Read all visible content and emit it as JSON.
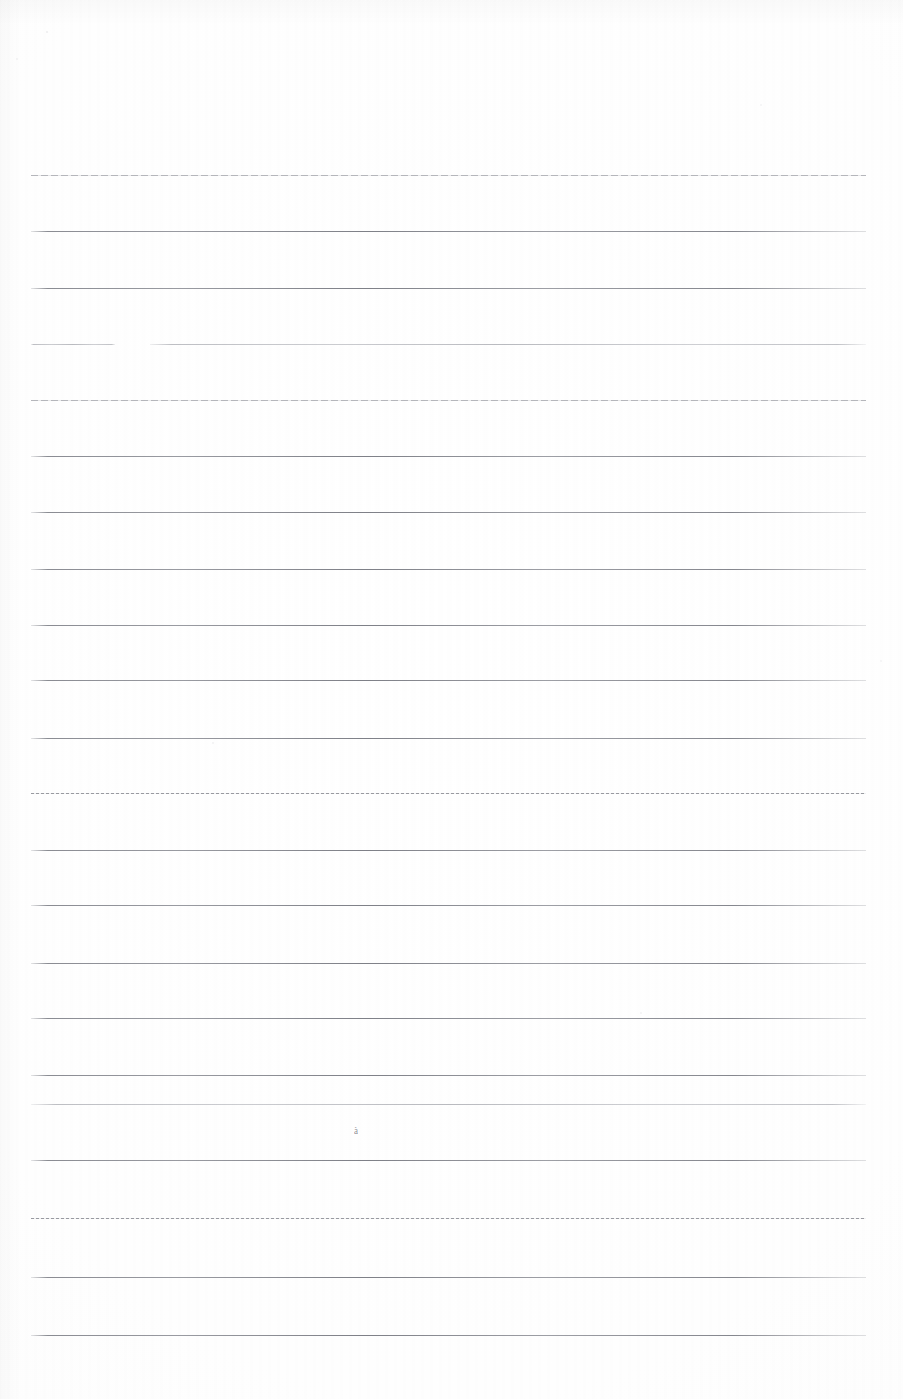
{
  "document": {
    "kind": "scanned-lined-paper",
    "title": "Blank ruled notebook page (scan)",
    "page_width": 903,
    "page_height": 1399,
    "background_color": "#fefefe",
    "rule_color": "#76787f",
    "rule_color_faint": "#9496a0",
    "text_content": "",
    "written_content_present": false,
    "margin_left": 31,
    "margin_right": 866,
    "line_spacing": 56,
    "line_count": 22
  },
  "ruled_lines": [
    {
      "index": 1,
      "y": 175,
      "style": "halftone",
      "segments": [
        {
          "x": 31,
          "width": 835
        }
      ]
    },
    {
      "index": 2,
      "y": 231,
      "style": "solid",
      "segments": [
        {
          "x": 31,
          "width": 835
        }
      ]
    },
    {
      "index": 3,
      "y": 288,
      "style": "solid",
      "segments": [
        {
          "x": 31,
          "width": 835
        }
      ]
    },
    {
      "index": 4,
      "y": 344,
      "style": "faint",
      "segments": [
        {
          "x": 31,
          "width": 84
        },
        {
          "x": 150,
          "width": 716
        }
      ]
    },
    {
      "index": 5,
      "y": 400,
      "style": "halftone",
      "segments": [
        {
          "x": 31,
          "width": 835
        }
      ]
    },
    {
      "index": 6,
      "y": 456,
      "style": "solid",
      "segments": [
        {
          "x": 31,
          "width": 835
        }
      ]
    },
    {
      "index": 7,
      "y": 512,
      "style": "solid",
      "segments": [
        {
          "x": 31,
          "width": 835
        }
      ]
    },
    {
      "index": 8,
      "y": 569,
      "style": "solid",
      "segments": [
        {
          "x": 31,
          "width": 835
        }
      ]
    },
    {
      "index": 9,
      "y": 625,
      "style": "solid",
      "segments": [
        {
          "x": 31,
          "width": 835
        }
      ]
    },
    {
      "index": 10,
      "y": 680,
      "style": "solid",
      "segments": [
        {
          "x": 31,
          "width": 835
        }
      ]
    },
    {
      "index": 11,
      "y": 738,
      "style": "solid",
      "segments": [
        {
          "x": 31,
          "width": 835
        }
      ]
    },
    {
      "index": 12,
      "y": 793,
      "style": "dotted",
      "segments": [
        {
          "x": 31,
          "width": 835
        }
      ]
    },
    {
      "index": 13,
      "y": 850,
      "style": "solid",
      "segments": [
        {
          "x": 31,
          "width": 835
        }
      ]
    },
    {
      "index": 14,
      "y": 905,
      "style": "solid",
      "segments": [
        {
          "x": 31,
          "width": 835
        }
      ]
    },
    {
      "index": 15,
      "y": 963,
      "style": "solid",
      "segments": [
        {
          "x": 31,
          "width": 835
        }
      ]
    },
    {
      "index": 16,
      "y": 1018,
      "style": "solid",
      "segments": [
        {
          "x": 31,
          "width": 835
        }
      ]
    },
    {
      "index": 17,
      "y": 1075,
      "style": "solid",
      "segments": [
        {
          "x": 31,
          "width": 835
        }
      ]
    },
    {
      "index": 18,
      "y": 1104,
      "style": "faint",
      "segments": [
        {
          "x": 31,
          "width": 835
        }
      ]
    },
    {
      "index": 19,
      "y": 1160,
      "style": "solid",
      "segments": [
        {
          "x": 31,
          "width": 835
        }
      ]
    },
    {
      "index": 20,
      "y": 1218,
      "style": "dotted",
      "segments": [
        {
          "x": 31,
          "width": 835
        }
      ]
    },
    {
      "index": 21,
      "y": 1277,
      "style": "solid",
      "segments": [
        {
          "x": 31,
          "width": 835
        }
      ]
    },
    {
      "index": 22,
      "y": 1335,
      "style": "solid",
      "segments": [
        {
          "x": 31,
          "width": 835
        }
      ]
    }
  ],
  "annotations": {
    "stray_mark": {
      "label": "faint pencil smudge",
      "glyph": "à",
      "x": 354,
      "y": 1126
    }
  },
  "specks": [
    {
      "x": 46,
      "y": 31,
      "size": 2,
      "opacity": 0.1
    },
    {
      "x": 16,
      "y": 58,
      "size": 2,
      "opacity": 0.07
    },
    {
      "x": 760,
      "y": 104,
      "size": 2,
      "opacity": 0.06
    },
    {
      "x": 212,
      "y": 742,
      "size": 2,
      "opacity": 0.08
    },
    {
      "x": 640,
      "y": 1012,
      "size": 2,
      "opacity": 0.07
    },
    {
      "x": 880,
      "y": 660,
      "size": 2,
      "opacity": 0.06
    }
  ]
}
